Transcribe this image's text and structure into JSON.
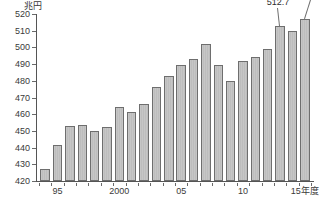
{
  "chart_data": {
    "type": "bar",
    "title": "",
    "subtitle": "",
    "xlabel": "",
    "ylabel": "",
    "unit_label": "兆円",
    "ylim": [
      420,
      520
    ],
    "ytick_step": 10,
    "ytick_labels": [
      "420",
      "430",
      "440",
      "450",
      "460",
      "470",
      "480",
      "490",
      "500",
      "510",
      "520"
    ],
    "ytick_values": [
      420,
      430,
      440,
      450,
      460,
      470,
      480,
      490,
      500,
      510,
      520
    ],
    "grid": false,
    "legend": null,
    "xtick_labels": [
      "95",
      "2000",
      "05",
      "10",
      "15年度"
    ],
    "xtick_indices": [
      1,
      6,
      11,
      16,
      21
    ],
    "categories": [
      "94",
      "95",
      "96",
      "97",
      "98",
      "99",
      "2000",
      "01",
      "02",
      "03",
      "04",
      "05",
      "06",
      "07",
      "08",
      "09",
      "10",
      "11",
      "12",
      "13",
      "14",
      "15"
    ],
    "values": [
      427.0,
      441.5,
      453.2,
      453.4,
      450.1,
      452.6,
      464.5,
      461.6,
      466.0,
      476.0,
      483.0,
      489.5,
      493.3,
      501.8,
      489.5,
      480.0,
      492.0,
      494.5,
      499.0,
      512.7,
      510.0,
      517.2
    ],
    "annotations": [
      {
        "label": "512.7",
        "category": "13",
        "value": 512.7
      },
      {
        "label": "517.2",
        "category": "15",
        "value": 517.2
      }
    ]
  }
}
